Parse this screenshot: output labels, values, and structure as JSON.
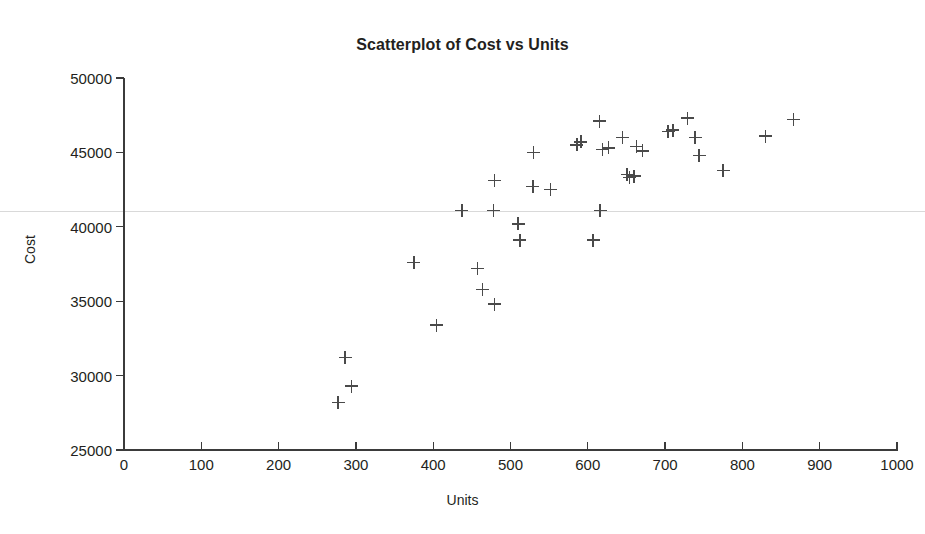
{
  "page": {
    "top_sliver_text": ""
  },
  "chart_data": {
    "type": "scatter",
    "title": "Scatterplot of Cost vs Units",
    "xlabel": "Units",
    "ylabel": "Cost",
    "xlim": [
      0,
      1000
    ],
    "ylim": [
      25000,
      50000
    ],
    "xticks": [
      0,
      100,
      200,
      300,
      400,
      500,
      600,
      700,
      800,
      900,
      1000
    ],
    "yticks": [
      25000,
      30000,
      35000,
      40000,
      45000,
      50000
    ],
    "xtick_labels": [
      "0",
      "100",
      "200",
      "300",
      "400",
      "500",
      "600",
      "700",
      "800",
      "900",
      "1000"
    ],
    "ytick_labels": [
      "25000",
      "30000",
      "35000",
      "40000",
      "45000",
      "50000"
    ],
    "grid": false,
    "legend": null,
    "marker": "plus",
    "marker_color": "#4a4a4a",
    "series": [
      {
        "name": "Cost vs Units",
        "points": [
          [
            277,
            28200
          ],
          [
            286,
            31200
          ],
          [
            294,
            29300
          ],
          [
            375,
            37600
          ],
          [
            404,
            33400
          ],
          [
            437,
            41100
          ],
          [
            457,
            37200
          ],
          [
            464,
            35800
          ],
          [
            478,
            41100
          ],
          [
            479,
            43100
          ],
          [
            479,
            34800
          ],
          [
            510,
            40200
          ],
          [
            512,
            39100
          ],
          [
            529,
            42700
          ],
          [
            530,
            45000
          ],
          [
            552,
            42500
          ],
          [
            586,
            45500
          ],
          [
            591,
            45700
          ],
          [
            615,
            47100
          ],
          [
            616,
            41100
          ],
          [
            607,
            39100
          ],
          [
            619,
            45200
          ],
          [
            627,
            45300
          ],
          [
            645,
            46000
          ],
          [
            651,
            43500
          ],
          [
            654,
            43300
          ],
          [
            660,
            43400
          ],
          [
            663,
            45400
          ],
          [
            671,
            45100
          ],
          [
            704,
            46400
          ],
          [
            710,
            46500
          ],
          [
            729,
            47300
          ],
          [
            739,
            46000
          ],
          [
            744,
            44800
          ],
          [
            775,
            43800
          ],
          [
            830,
            46100
          ],
          [
            866,
            47200
          ]
        ]
      }
    ]
  }
}
